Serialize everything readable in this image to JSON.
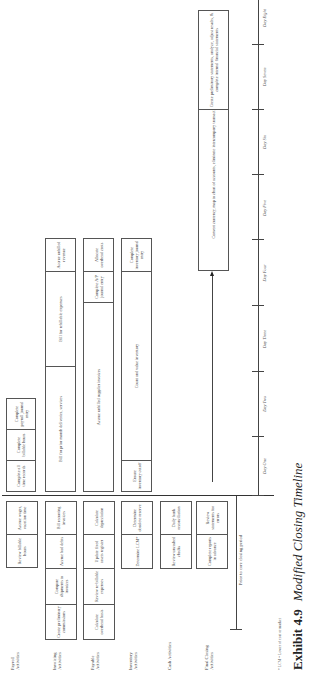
{
  "caption": {
    "number": "Exhibit 4.9",
    "title": "Modified Closing Timeline"
  },
  "footnote": "* LCM = Lower of cost or market",
  "rows": {
    "payroll": "Payroll Activities",
    "invoicing": "Invoicing Activities",
    "payable": "Payable Activities",
    "inventory": "Inventory Activities",
    "cash": "Cash Activities",
    "final": "Final Closing Activities"
  },
  "prior": {
    "payroll": [
      "Review billable hours",
      "Accrue wages, vacation time"
    ],
    "invoicing": [
      "Create preliminary commissions",
      "Compare shipments to invoices",
      "Accrue bad debts",
      "Bill recurring invoices"
    ],
    "payable": [
      "Calculate overhead basis",
      "Review re-billable expenses",
      "Update fixed assets register",
      "Calculate depreciation"
    ],
    "inventory": [
      "Determine LCM*",
      "Determine obsolete reserve"
    ],
    "cash": [
      "Review uncashed checks",
      "Daily bank reconciliation"
    ],
    "final": [
      "Complete reports in advance",
      "Review statements for errors"
    ]
  },
  "closing": {
    "payroll": [
      "Complete all time records",
      "Complete billable hours",
      "Complete payroll journal entry"
    ],
    "invoicing": [
      "Bill for prior month deliveries, services",
      "Bill for rebillable expenses",
      "Accrue unbilled revenue"
    ],
    "payable": [
      "Accrue unbilled supplier invoices",
      "Complete A/P journal entry",
      "Allocate overhead costs"
    ],
    "inventory": [
      "Ensure inventory cutoff",
      "Count and value inventory",
      "Complete inventory journal entry"
    ],
    "final": [
      "Convert currency, map to chart of accounts, eliminate intercompany transactions",
      "Create preliminary statements, analyze, adjust results, & complete internal financial statements"
    ]
  },
  "timeline": {
    "prior_label": "Prior to core closing period",
    "days": [
      "Day One",
      "Day Two",
      "Day Three",
      "Day Four",
      "Day Five",
      "Day Six",
      "Day Seven",
      "Day Eight"
    ]
  }
}
